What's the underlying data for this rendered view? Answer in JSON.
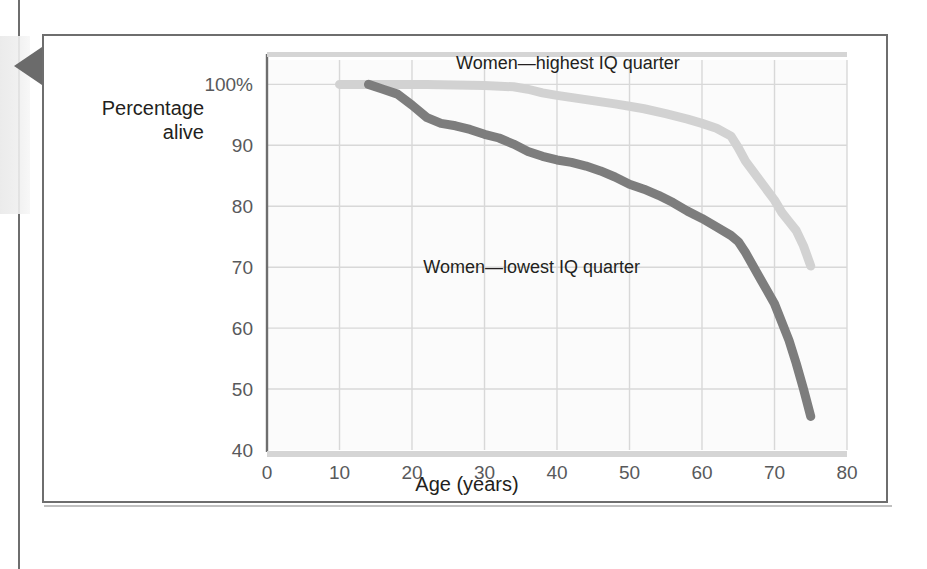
{
  "figure": {
    "marker_icon": "left-triangle-marker",
    "frame_color": "#6e6e6e"
  },
  "chart_data": {
    "type": "line",
    "title": "",
    "xlabel": "Age (years)",
    "ylabel": "Percentage alive",
    "ylabel_line1": "Percentage",
    "ylabel_line2": "alive",
    "xlim": [
      0,
      80
    ],
    "ylim": [
      40,
      104
    ],
    "grid": true,
    "legend_position": "inline-annotations",
    "xticks": [
      0,
      10,
      20,
      30,
      40,
      50,
      60,
      70,
      80
    ],
    "xtick_labels": [
      "0",
      "10",
      "20",
      "30",
      "40",
      "50",
      "60",
      "70",
      "80"
    ],
    "yticks": [
      40,
      50,
      60,
      70,
      80,
      90,
      100
    ],
    "ytick_labels": [
      "40",
      "50",
      "60",
      "70",
      "80",
      "90",
      "100%"
    ],
    "colors": {
      "highest_iq": "#d2d2d2",
      "lowest_iq": "#7d7d7d",
      "gridline": "#d8d8d8",
      "axis": "#6e6e6e",
      "plot_background": "#fbfbfb"
    },
    "series": [
      {
        "name": "Women—highest IQ quarter",
        "label": "Women—highest IQ quarter",
        "color": "#d2d2d2",
        "label_x": 41.5,
        "label_y": 102.5,
        "x": [
          10,
          14,
          18,
          22,
          26,
          30,
          34,
          36,
          38,
          40,
          44,
          48,
          50,
          52,
          55,
          58,
          60,
          62,
          64,
          65,
          66,
          68,
          70,
          71,
          72,
          73,
          74,
          75
        ],
        "y": [
          100,
          100,
          100,
          100,
          99.9,
          99.8,
          99.6,
          99.2,
          98.6,
          98.2,
          97.5,
          96.8,
          96.4,
          96.0,
          95.2,
          94.3,
          93.6,
          92.8,
          91.5,
          89.6,
          87.4,
          84.2,
          81.0,
          79.0,
          77.5,
          76.0,
          73.5,
          70.2
        ]
      },
      {
        "name": "Women—lowest IQ quarter",
        "label": "Women—lowest IQ quarter",
        "color": "#7d7d7d",
        "label_x": 36.5,
        "label_y": 69.0,
        "x": [
          14,
          16,
          18,
          20,
          22,
          24,
          26,
          28,
          30,
          32,
          34,
          36,
          38,
          40,
          42,
          44,
          46,
          48,
          50,
          52,
          54,
          56,
          58,
          60,
          62,
          64,
          65,
          66,
          68,
          70,
          72,
          73,
          74,
          75
        ],
        "y": [
          100,
          99.2,
          98.4,
          96.6,
          94.6,
          93.6,
          93.2,
          92.6,
          91.8,
          91.2,
          90.2,
          89.0,
          88.2,
          87.6,
          87.2,
          86.6,
          85.8,
          84.8,
          83.6,
          82.8,
          81.8,
          80.6,
          79.2,
          78.0,
          76.6,
          75.2,
          74.2,
          72.4,
          68.2,
          64.0,
          58.0,
          54.2,
          50.0,
          45.5
        ]
      }
    ]
  }
}
